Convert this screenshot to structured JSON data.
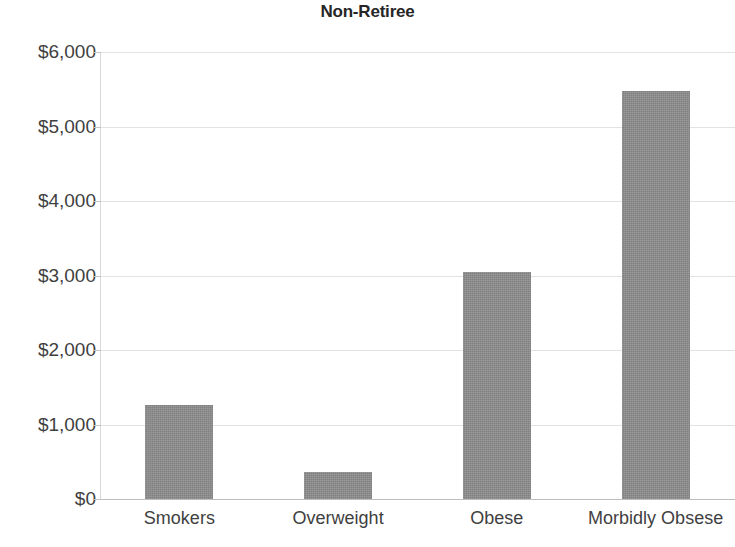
{
  "chart_data": {
    "type": "bar",
    "title": "Non-Retiree",
    "xlabel": "",
    "ylabel": "",
    "categories": [
      "Smokers",
      "Overweight",
      "Obese",
      "Morbidly Obsese"
    ],
    "values": [
      1260,
      360,
      3050,
      5480
    ],
    "ylim": [
      0,
      6000
    ],
    "ytick_values": [
      0,
      1000,
      2000,
      3000,
      4000,
      5000,
      6000
    ],
    "ytick_labels": [
      "$0",
      "$1,000",
      "$2,000",
      "$3,000",
      "$4,000",
      "$5,000",
      "$6,000"
    ],
    "grid": true,
    "legend": null,
    "series": [
      {
        "name": "Non-Retiree",
        "values": [
          1260,
          360,
          3050,
          5480
        ],
        "color": "#8c8c8c"
      }
    ],
    "colors": {
      "bar": "#8c8c8c",
      "gridline": "#e2e2e2",
      "axis": "#bdbdbd",
      "text": "#3f3f3f",
      "title": "#262626",
      "background": "#ffffff"
    }
  }
}
